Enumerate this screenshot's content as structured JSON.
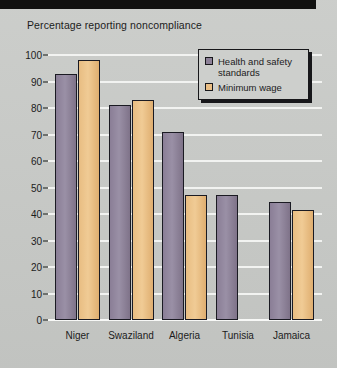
{
  "figure": {
    "title": "Percentage reporting noncompliance",
    "top_band": "black-bar"
  },
  "legend": {
    "position": "top-right",
    "entries": [
      {
        "label": "Health and safety standards",
        "color": "#8d8198",
        "key": "hs"
      },
      {
        "label": "Minimum wage",
        "color": "#eabe84",
        "key": "mw"
      }
    ]
  },
  "axis": {
    "y_ticks": [
      "0",
      "10",
      "20",
      "30",
      "40",
      "50",
      "60",
      "70",
      "80",
      "90",
      "100"
    ],
    "x_ticks": [
      "Niger",
      "Swaziland",
      "Algeria",
      "Tunisia",
      "Jamaica"
    ]
  },
  "chart_data": {
    "type": "bar",
    "title": "Percentage reporting noncompliance",
    "xlabel": "",
    "ylabel": "",
    "ylim": [
      0,
      100
    ],
    "ytick_step": 10,
    "grid": true,
    "legend_position": "top-right",
    "categories": [
      "Niger",
      "Swaziland",
      "Algeria",
      "Tunisia",
      "Jamaica"
    ],
    "series": [
      {
        "name": "Health and safety standards",
        "color": "#8d8198",
        "values": [
          93,
          81,
          71,
          47,
          44.5
        ]
      },
      {
        "name": "Minimum wage",
        "color": "#eabe84",
        "values": [
          98,
          83,
          47,
          null,
          41.5
        ]
      }
    ]
  }
}
